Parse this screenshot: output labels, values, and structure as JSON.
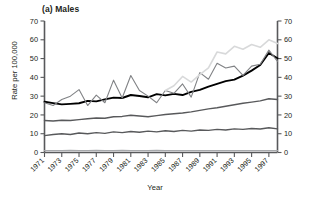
{
  "figure": {
    "panel_title": "(a) Males",
    "cropped_header": "",
    "xlabel": "Year",
    "ylabel": "Rate per 100,000"
  },
  "axes": {
    "y_ticks": [
      0,
      10,
      20,
      30,
      40,
      50,
      60,
      70
    ],
    "y_ticks_right": [
      0,
      10,
      20,
      30,
      40,
      50,
      60,
      70
    ],
    "x_ticks": [
      1971,
      1973,
      1975,
      1977,
      1979,
      1981,
      1983,
      1985,
      1987,
      1989,
      1991,
      1993,
      1995,
      1997
    ]
  },
  "colors": {
    "series_1": "#000000",
    "series_2": "#58595b",
    "series_3": "#58595b",
    "series_4": "#808285",
    "series_5": "#a7a9ac",
    "series_6": "#d8d9da",
    "axis": "#58595b"
  },
  "chart_data": {
    "type": "line",
    "title": "(a) Males",
    "xlabel": "Year",
    "ylabel": "Rate per 100,000",
    "xlim": [
      1971,
      1998
    ],
    "ylim": [
      0,
      70
    ],
    "grid": false,
    "legend": "none",
    "x": [
      1971,
      1972,
      1973,
      1974,
      1975,
      1976,
      1977,
      1978,
      1979,
      1980,
      1981,
      1982,
      1983,
      1984,
      1985,
      1986,
      1987,
      1988,
      1989,
      1990,
      1991,
      1992,
      1993,
      1994,
      1995,
      1996,
      1997,
      1998
    ],
    "series": [
      {
        "name": "series-1-thick-black",
        "color": "#000000",
        "width": 1.9,
        "values": [
          27.0,
          26.3,
          25.6,
          25.9,
          26.2,
          27.5,
          27.2,
          28.3,
          29.2,
          29.0,
          30.6,
          30.1,
          29.4,
          31.1,
          30.4,
          31.2,
          30.6,
          32.3,
          33.3,
          35.1,
          36.5,
          38.0,
          38.8,
          40.9,
          43.6,
          46.6,
          53.0,
          50.2
        ]
      },
      {
        "name": "series-2-jagged-mid-grey",
        "color": "#808285",
        "width": 1.1,
        "values": [
          26.5,
          25.0,
          28.2,
          30.0,
          33.5,
          25.0,
          30.5,
          26.5,
          38.5,
          29.0,
          41.0,
          33.0,
          30.0,
          26.5,
          33.0,
          31.5,
          36.5,
          29.5,
          42.5,
          39.0,
          47.5,
          45.0,
          46.0,
          41.0,
          46.0,
          47.0,
          54.5,
          48.5
        ]
      },
      {
        "name": "series-3-light-grey-upper",
        "color": "#d8d9da",
        "width": 1.6,
        "values": [
          null,
          null,
          null,
          null,
          null,
          null,
          null,
          null,
          null,
          null,
          null,
          null,
          null,
          null,
          33.0,
          35.5,
          40.5,
          37.5,
          41.5,
          45.0,
          53.5,
          52.5,
          56.5,
          55.0,
          57.5,
          56.0,
          60.0,
          58.0
        ]
      },
      {
        "name": "series-4-mid-grey",
        "color": "#58595b",
        "width": 1.4,
        "values": [
          17.0,
          16.8,
          17.2,
          17.0,
          17.5,
          18.0,
          18.4,
          18.2,
          19.0,
          19.2,
          19.8,
          19.4,
          19.0,
          19.6,
          20.2,
          20.6,
          21.0,
          21.6,
          22.4,
          23.2,
          23.8,
          24.6,
          25.4,
          26.2,
          26.8,
          27.5,
          28.6,
          28.2
        ]
      },
      {
        "name": "series-5-lower-grey",
        "color": "#58595b",
        "width": 1.4,
        "values": [
          9.0,
          9.6,
          10.0,
          9.6,
          10.4,
          10.0,
          10.6,
          10.2,
          11.0,
          10.6,
          11.2,
          10.8,
          11.4,
          11.0,
          11.6,
          11.2,
          11.8,
          11.4,
          12.0,
          11.8,
          12.3,
          12.0,
          12.6,
          12.3,
          12.8,
          12.5,
          13.2,
          12.6
        ]
      },
      {
        "name": "series-6-baseline",
        "color": "#a7a9ac",
        "width": 1.2,
        "values": [
          1.0,
          1.0,
          1.0,
          1.1,
          1.0,
          1.0,
          1.1,
          1.0,
          1.0,
          1.1,
          1.0,
          1.0,
          1.0,
          1.1,
          1.0,
          1.0,
          1.0,
          1.0,
          1.0,
          1.0,
          1.0,
          1.0,
          1.0,
          1.0,
          1.0,
          1.0,
          1.0,
          1.0
        ]
      }
    ]
  }
}
